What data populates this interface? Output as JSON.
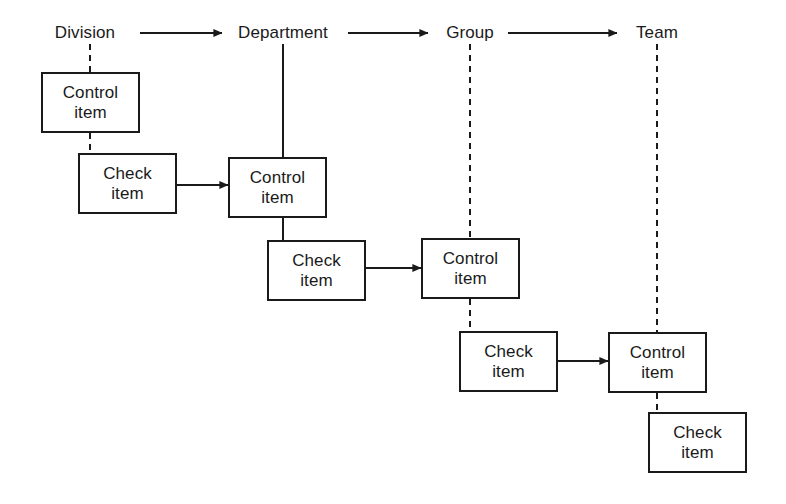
{
  "diagram": {
    "background_color": "#ffffff",
    "line_color": "#1a1a1a",
    "columns": [
      {
        "id": "division",
        "label": "Division",
        "x": 85,
        "y": 33
      },
      {
        "id": "department",
        "label": "Department",
        "x": 283,
        "y": 33
      },
      {
        "id": "group",
        "label": "Group",
        "x": 470,
        "y": 33
      },
      {
        "id": "team",
        "label": "Team",
        "x": 657,
        "y": 33
      }
    ],
    "header_arrows": [
      {
        "id": "division-to-department",
        "x1": 140,
        "y": 33,
        "x2": 222
      },
      {
        "id": "department-to-group",
        "x1": 348,
        "y": 33,
        "x2": 428
      },
      {
        "id": "group-to-team",
        "x1": 508,
        "y": 33,
        "x2": 617
      }
    ],
    "nodes": [
      {
        "id": "control-item-division",
        "type": "control",
        "line1": "Control",
        "line2": "item",
        "x": 41,
        "y": 72,
        "w": 99,
        "h": 61
      },
      {
        "id": "check-item-division",
        "type": "check",
        "line1": "Check",
        "line2": "item",
        "x": 78,
        "y": 153,
        "w": 99,
        "h": 61
      },
      {
        "id": "control-item-department",
        "type": "control",
        "line1": "Control",
        "line2": "item",
        "x": 228,
        "y": 157,
        "w": 99,
        "h": 61
      },
      {
        "id": "check-item-department",
        "type": "check",
        "line1": "Check",
        "line2": "item",
        "x": 267,
        "y": 240,
        "w": 99,
        "h": 61
      },
      {
        "id": "control-item-group",
        "type": "control",
        "line1": "Control",
        "line2": "item",
        "x": 421,
        "y": 238,
        "w": 99,
        "h": 61
      },
      {
        "id": "check-item-group",
        "type": "check",
        "line1": "Check",
        "line2": "item",
        "x": 459,
        "y": 331,
        "w": 99,
        "h": 61
      },
      {
        "id": "control-item-team",
        "type": "control",
        "line1": "Control",
        "line2": "item",
        "x": 608,
        "y": 332,
        "w": 99,
        "h": 61
      },
      {
        "id": "check-item-team",
        "type": "check",
        "line1": "Check",
        "line2": "item",
        "x": 648,
        "y": 412,
        "w": 99,
        "h": 61
      }
    ],
    "vertical_connectors": [
      {
        "id": "division-label-to-control",
        "x": 90,
        "y1": 44,
        "y2": 72,
        "style": "dashed"
      },
      {
        "id": "division-control-to-check",
        "x": 90,
        "y1": 133,
        "y2": 153,
        "style": "dashed"
      },
      {
        "id": "department-label-to-control",
        "x": 283,
        "y1": 44,
        "y2": 157,
        "style": "solid"
      },
      {
        "id": "department-control-to-check",
        "x": 283,
        "y1": 218,
        "y2": 240,
        "style": "solid"
      },
      {
        "id": "group-label-to-control",
        "x": 470,
        "y1": 44,
        "y2": 238,
        "style": "dashed"
      },
      {
        "id": "group-control-to-check",
        "x": 470,
        "y1": 299,
        "y2": 331,
        "style": "dashed"
      },
      {
        "id": "team-label-to-control",
        "x": 657,
        "y1": 44,
        "y2": 332,
        "style": "dashed"
      },
      {
        "id": "team-control-to-check",
        "x": 657,
        "y1": 393,
        "y2": 412,
        "style": "dashed"
      }
    ],
    "flow_arrows": [
      {
        "id": "check-division-to-control-department",
        "x1": 177,
        "y": 185,
        "x2": 228
      },
      {
        "id": "check-department-to-control-group",
        "x1": 366,
        "y": 268,
        "x2": 421
      },
      {
        "id": "check-group-to-control-team",
        "x1": 558,
        "y": 361,
        "x2": 608
      }
    ]
  }
}
